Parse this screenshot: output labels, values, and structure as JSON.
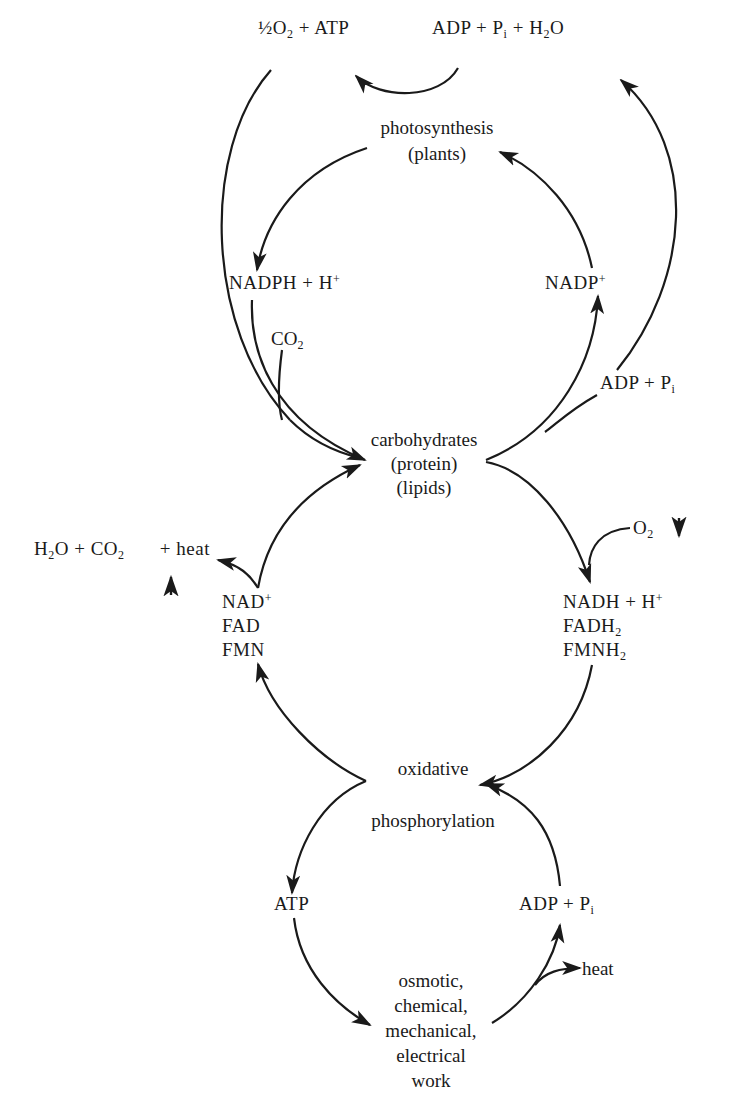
{
  "diagram": {
    "type": "metabolic-cycle",
    "top": {
      "left_product": {
        "pre": "½O",
        "sub": "2",
        "post": " + ATP"
      },
      "right_reactant": {
        "a": "ADP + P",
        "i": "i",
        "b": " + H",
        "sub": "2",
        "c": "O"
      }
    },
    "photosynthesis": {
      "line1": "photosynthesis",
      "line2": "(plants)"
    },
    "nadph": {
      "text": "NADPH + H",
      "sup": "+"
    },
    "nadp": {
      "text": "NADP",
      "sup": "+"
    },
    "co2_in": {
      "text": "CO",
      "sub": "2"
    },
    "adp_pi_mid": {
      "text": "ADP + P",
      "sub": "i"
    },
    "carbohydrates": {
      "line1": "carbohydrates",
      "line2": "(protein)",
      "line3": "(lipids)"
    },
    "release": {
      "h2o": "H",
      "sub1": "2",
      "o": "O + CO",
      "sub2": "2",
      "arrow": "↑",
      "heat": "+ heat"
    },
    "o2_in": {
      "text": "O",
      "sub": "2",
      "arrow": "↓"
    },
    "oxidized_carriers": {
      "nad": "NAD",
      "nad_sup": "+",
      "fad": "FAD",
      "fmn": "FMN"
    },
    "reduced_carriers": {
      "nadh": "NADH + H",
      "nadh_sup": "+",
      "fadh": "FADH",
      "fadh_sub": "2",
      "fmnh": "FMNH",
      "fmnh_sub": "2"
    },
    "oxphos": {
      "line1": "oxidative",
      "line2": "phosphorylation"
    },
    "atp_bottom": "ATP",
    "adp_pi_bottom": {
      "text": "ADP + P",
      "sub": "i"
    },
    "heat_bottom": "heat",
    "work": {
      "line1": "osmotic,",
      "line2": "chemical,",
      "line3": "mechanical,",
      "line4": "electrical",
      "line5": "work"
    }
  }
}
